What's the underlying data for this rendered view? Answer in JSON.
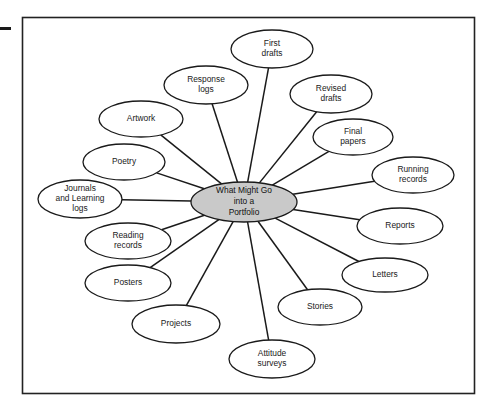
{
  "figure": {
    "frame": {
      "x": 22,
      "y": 17,
      "width": 452,
      "height": 376,
      "border_color": "#222222"
    },
    "left_tick": {
      "x": 0,
      "y": 27,
      "width": 11,
      "height": 3,
      "color": "#1a1a1a"
    },
    "line_color": "#1a1a1a",
    "node_fill": "#ffffff",
    "node_stroke": "#1a1a1a",
    "center_fill": "#c9c9c9",
    "center_stroke": "#1a1a1a"
  },
  "chart_data": {
    "type": "diagram",
    "diagram_kind": "spider-web-concept-map",
    "center": {
      "label": "What Might Go into a Portfolio",
      "lines": [
        "What Might Go",
        "into a",
        "Portfolio"
      ],
      "cx": 244,
      "cy": 202,
      "rx": 53,
      "ry": 20
    },
    "nodes": [
      {
        "id": "first-drafts",
        "lines": [
          "First",
          "drafts"
        ],
        "cx": 272,
        "cy": 49,
        "rx": 41,
        "ry": 19
      },
      {
        "id": "response-logs",
        "lines": [
          "Response",
          "logs"
        ],
        "cx": 206,
        "cy": 85,
        "rx": 42,
        "ry": 19
      },
      {
        "id": "revised-drafts",
        "lines": [
          "Revised",
          "drafts"
        ],
        "cx": 331,
        "cy": 94,
        "rx": 41,
        "ry": 19
      },
      {
        "id": "artwork",
        "lines": [
          "Artwork"
        ],
        "cx": 141,
        "cy": 119,
        "rx": 42,
        "ry": 18
      },
      {
        "id": "final-papers",
        "lines": [
          "Final",
          "papers"
        ],
        "cx": 353,
        "cy": 137,
        "rx": 40,
        "ry": 18
      },
      {
        "id": "poetry",
        "lines": [
          "Poetry"
        ],
        "cx": 124,
        "cy": 162,
        "rx": 41,
        "ry": 18
      },
      {
        "id": "running-records",
        "lines": [
          "Running",
          "records"
        ],
        "cx": 413,
        "cy": 175,
        "rx": 41,
        "ry": 18
      },
      {
        "id": "journals-and-learning-logs",
        "lines": [
          "Journals",
          "and Learning",
          "logs"
        ],
        "cx": 80,
        "cy": 199,
        "rx": 42,
        "ry": 19
      },
      {
        "id": "reports",
        "lines": [
          "Reports"
        ],
        "cx": 400,
        "cy": 226,
        "rx": 43,
        "ry": 18
      },
      {
        "id": "reading-records",
        "lines": [
          "Reading",
          "records"
        ],
        "cx": 128,
        "cy": 241,
        "rx": 43,
        "ry": 18
      },
      {
        "id": "letters",
        "lines": [
          "Letters"
        ],
        "cx": 385,
        "cy": 275,
        "rx": 43,
        "ry": 17
      },
      {
        "id": "posters",
        "lines": [
          "Posters"
        ],
        "cx": 128,
        "cy": 283,
        "rx": 43,
        "ry": 18
      },
      {
        "id": "stories",
        "lines": [
          "Stories"
        ],
        "cx": 320,
        "cy": 307,
        "rx": 42,
        "ry": 18
      },
      {
        "id": "projects",
        "lines": [
          "Projects"
        ],
        "cx": 176,
        "cy": 324,
        "rx": 44,
        "ry": 19
      },
      {
        "id": "attitude-surveys",
        "lines": [
          "Attitude",
          "surveys"
        ],
        "cx": 272,
        "cy": 359,
        "rx": 43,
        "ry": 19
      }
    ],
    "edges": [
      {
        "from": "center",
        "to": "first-drafts"
      },
      {
        "from": "center",
        "to": "response-logs"
      },
      {
        "from": "center",
        "to": "revised-drafts"
      },
      {
        "from": "center",
        "to": "artwork"
      },
      {
        "from": "center",
        "to": "final-papers"
      },
      {
        "from": "center",
        "to": "poetry"
      },
      {
        "from": "center",
        "to": "running-records"
      },
      {
        "from": "center",
        "to": "journals-and-learning-logs"
      },
      {
        "from": "center",
        "to": "reports"
      },
      {
        "from": "center",
        "to": "reading-records"
      },
      {
        "from": "center",
        "to": "letters"
      },
      {
        "from": "center",
        "to": "posters"
      },
      {
        "from": "center",
        "to": "stories"
      },
      {
        "from": "center",
        "to": "projects"
      },
      {
        "from": "center",
        "to": "attitude-surveys"
      }
    ]
  }
}
